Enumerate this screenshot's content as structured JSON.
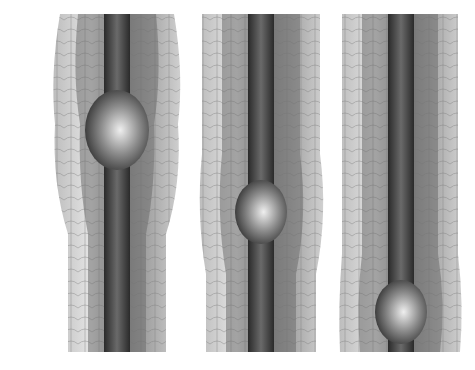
{
  "illustration": {
    "subject": "peristalsis-sequence",
    "panels": [
      {
        "id": "panel-1",
        "x": 50,
        "width": 134,
        "bolus_center_y": 116,
        "bolus_rx": 32,
        "bolus_ry": 40
      },
      {
        "id": "panel-2",
        "x": 196,
        "width": 134,
        "bolus_center_y": 198,
        "bolus_rx": 26,
        "bolus_ry": 32
      },
      {
        "id": "panel-3",
        "x": 338,
        "width": 126,
        "bolus_center_y": 298,
        "bolus_rx": 26,
        "bolus_ry": 32
      }
    ],
    "colors": {
      "background": "#ffffff",
      "outer_wall_light": "#d9d9d9",
      "outer_wall_dark": "#6e6e6e",
      "lumen": "#4a4a4a",
      "bolus_highlight": "#e6e6e6",
      "bolus_shadow": "#2e2e2e"
    }
  }
}
